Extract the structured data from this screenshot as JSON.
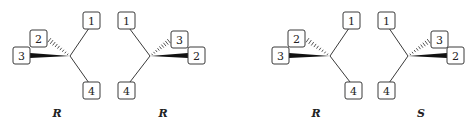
{
  "molecules": [
    {
      "config": "R",
      "center": [
        70,
        56
      ],
      "label_pos": [
        57,
        113
      ],
      "subs": {
        "1": {
          "box": [
            83,
            12
          ],
          "bond": "plain"
        },
        "2": {
          "box": [
            30,
            30
          ],
          "bond": "hash"
        },
        "3": {
          "box": [
            13,
            47
          ],
          "bond": "wedge"
        },
        "4": {
          "box": [
            83,
            82
          ],
          "bond": "plain"
        }
      }
    },
    {
      "config": "R",
      "center": [
        150,
        56
      ],
      "label_pos": [
        163,
        113
      ],
      "subs": {
        "1": {
          "box": [
            118,
            12
          ],
          "bond": "plain"
        },
        "3": {
          "box": [
            171,
            31
          ],
          "bond": "hash"
        },
        "2": {
          "box": [
            188,
            47
          ],
          "bond": "wedge"
        },
        "4": {
          "box": [
            118,
            82
          ],
          "bond": "plain"
        }
      }
    },
    {
      "config": "R",
      "center": [
        330,
        56
      ],
      "label_pos": [
        316,
        113
      ],
      "subs": {
        "1": {
          "box": [
            343,
            12
          ],
          "bond": "plain"
        },
        "2": {
          "box": [
            288,
            30
          ],
          "bond": "hash"
        },
        "3": {
          "box": [
            272,
            47
          ],
          "bond": "wedge"
        },
        "4": {
          "box": [
            345,
            82
          ],
          "bond": "plain"
        }
      }
    },
    {
      "config": "S",
      "center": [
        408,
        56
      ],
      "label_pos": [
        421,
        113
      ],
      "subs": {
        "1": {
          "box": [
            378,
            12
          ],
          "bond": "plain"
        },
        "3": {
          "box": [
            431,
            31
          ],
          "bond": "hash"
        },
        "2": {
          "box": [
            447,
            47
          ],
          "bond": "wedge"
        },
        "4": {
          "box": [
            378,
            82
          ],
          "bond": "plain"
        }
      }
    }
  ],
  "labels": [
    "R",
    "R",
    "R",
    "S"
  ],
  "box_size": [
    17,
    17
  ]
}
